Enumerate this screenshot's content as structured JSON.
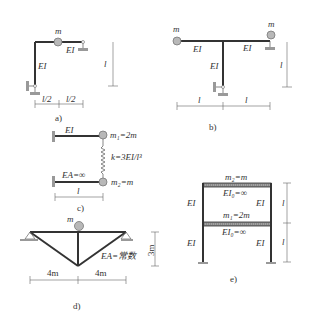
{
  "panels": {
    "a": {
      "caption": "a)",
      "mass_label": "m",
      "beam_label": "EI",
      "column_label": "EI",
      "dim_left": "l/2",
      "dim_right": "l/2",
      "dim_height": "l"
    },
    "b": {
      "caption": "b)",
      "mass_left_label": "m",
      "mass_right_label": "m",
      "beam_left_label": "EI",
      "beam_right_label": "EI",
      "column_label": "EI",
      "dim_left": "l",
      "dim_right": "l",
      "dim_height": "l"
    },
    "c": {
      "caption": "c)",
      "top_beam_label": "EI",
      "m1_label": "m₁=2m",
      "spring_label": "k=3EI/l³",
      "bottom_beam_label": "EA=∞",
      "m2_label": "m₂=m",
      "dim_length": "l"
    },
    "d": {
      "caption": "d)",
      "mass_label": "m",
      "member_label": "EA=常数",
      "dim_left": "4m",
      "dim_right": "4m",
      "dim_height": "3m"
    },
    "e": {
      "caption": "e)",
      "m2_label": "m₂=m",
      "top_girder_label": "EI₀=∞",
      "upper_col_left": "EI",
      "upper_col_right": "EI",
      "m1_label": "m₁=2m",
      "lower_girder_label": "EI₀=∞",
      "lower_col_left": "EI",
      "lower_col_right": "EI",
      "dim_upper": "l",
      "dim_lower": "l"
    }
  }
}
